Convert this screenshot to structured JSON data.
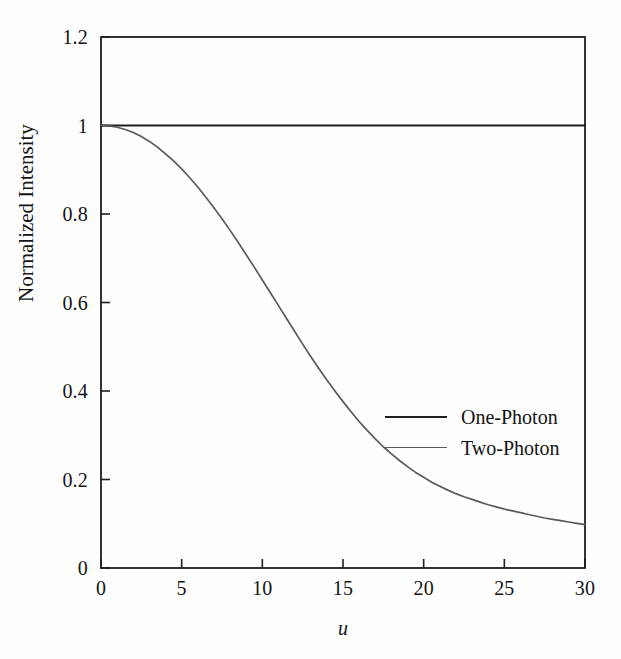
{
  "figure": {
    "background_color": "#fefefe",
    "frame_color": "#1f1f1f"
  },
  "axes": {
    "x": {
      "label": "u",
      "ticks": [
        "0",
        "5",
        "10",
        "15",
        "20",
        "25",
        "30"
      ],
      "min": 0,
      "max": 30
    },
    "y": {
      "label": "Normalized Intensity",
      "ticks": [
        "0",
        "0.2",
        "0.4",
        "0.6",
        "0.8",
        "1",
        "1.2"
      ],
      "min": 0,
      "max": 1.2
    }
  },
  "legend": {
    "items": [
      {
        "label": "One-Photon",
        "color": "#1f1f1f"
      },
      {
        "label": "Two-Photon",
        "color": "#5a5a5a"
      }
    ]
  },
  "chart_data": {
    "type": "line",
    "title": "",
    "xlabel": "u",
    "ylabel": "Normalized Intensity",
    "xlim": [
      0,
      30
    ],
    "ylim": [
      0,
      1.2
    ],
    "grid": false,
    "legend_position": "center-right",
    "xticks": [
      0,
      5,
      10,
      15,
      20,
      25,
      30
    ],
    "yticks": [
      0,
      0.2,
      0.4,
      0.6,
      0.8,
      1,
      1.2
    ],
    "x": [
      0,
      0.5,
      1,
      1.5,
      2,
      2.5,
      3,
      3.5,
      4,
      4.5,
      5,
      5.5,
      6,
      6.5,
      7,
      7.5,
      8,
      8.5,
      9,
      9.5,
      10,
      10.5,
      11,
      11.5,
      12,
      12.5,
      13,
      13.5,
      14,
      14.5,
      15,
      15.5,
      16,
      16.5,
      17,
      17.5,
      18,
      18.5,
      19,
      19.5,
      20,
      20.5,
      21,
      21.5,
      22,
      22.5,
      23,
      23.5,
      24,
      24.5,
      25,
      25.5,
      26,
      26.5,
      27,
      27.5,
      28,
      28.5,
      29,
      29.5,
      30
    ],
    "series": [
      {
        "name": "One-Photon",
        "color": "#1f1f1f",
        "values": [
          1,
          1,
          1,
          1,
          1,
          1,
          1,
          1,
          1,
          1,
          1,
          1,
          1,
          1,
          1,
          1,
          1,
          1,
          1,
          1,
          1,
          1,
          1,
          1,
          1,
          1,
          1,
          1,
          1,
          1,
          1,
          1,
          1,
          1,
          1,
          1,
          1,
          1,
          1,
          1,
          1,
          1,
          1,
          1,
          1,
          1,
          1,
          1,
          1,
          1,
          1,
          1,
          1,
          1,
          1,
          1,
          1,
          1,
          1,
          1,
          1
        ]
      },
      {
        "name": "Two-Photon",
        "color": "#5a5a5a",
        "values": [
          1.0,
          0.999,
          0.996,
          0.991,
          0.984,
          0.975,
          0.964,
          0.951,
          0.936,
          0.92,
          0.902,
          0.882,
          0.861,
          0.838,
          0.814,
          0.789,
          0.763,
          0.736,
          0.708,
          0.68,
          0.651,
          0.622,
          0.593,
          0.564,
          0.535,
          0.506,
          0.478,
          0.451,
          0.425,
          0.4,
          0.376,
          0.353,
          0.331,
          0.311,
          0.292,
          0.274,
          0.258,
          0.243,
          0.229,
          0.216,
          0.205,
          0.194,
          0.185,
          0.176,
          0.168,
          0.161,
          0.155,
          0.149,
          0.143,
          0.138,
          0.133,
          0.129,
          0.125,
          0.121,
          0.117,
          0.113,
          0.11,
          0.107,
          0.104,
          0.101,
          0.098
        ]
      }
    ],
    "note_two_photon_tail": [
      {
        "u": 15,
        "value": 0.146
      },
      {
        "u": 17.5,
        "value": 0.117
      },
      {
        "u": 20,
        "value": 0.095
      },
      {
        "u": 22.5,
        "value": 0.078
      },
      {
        "u": 25,
        "value": 0.062
      },
      {
        "u": 27.5,
        "value": 0.048
      },
      {
        "u": 30,
        "value": 0.033
      }
    ]
  }
}
